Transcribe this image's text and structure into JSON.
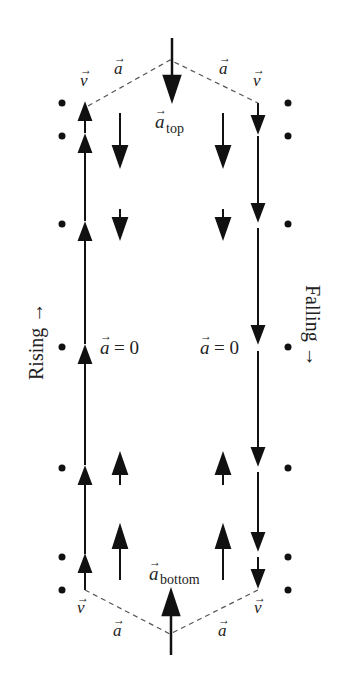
{
  "diagram": {
    "side_labels": {
      "left": "Rising →",
      "right": "Falling →"
    },
    "labels": {
      "a_top": "a",
      "a_top_sub": "top",
      "a_bottom": "a",
      "a_bottom_sub": "bottom",
      "a_zero_left": "= 0",
      "a_zero_right": "= 0",
      "a_var": "a",
      "v_var": "v"
    },
    "positions_y": [
      103,
      136,
      224,
      347,
      468,
      557,
      590
    ],
    "columns": {
      "left_dots_x": 62,
      "left_velocity_x": 85,
      "left_accel_x": 120,
      "center_x": 172,
      "right_accel_x": 223,
      "right_velocity_x": 258,
      "right_dots_x": 288
    },
    "colors": {
      "ink": "#111111",
      "dashed": "#555555"
    }
  }
}
